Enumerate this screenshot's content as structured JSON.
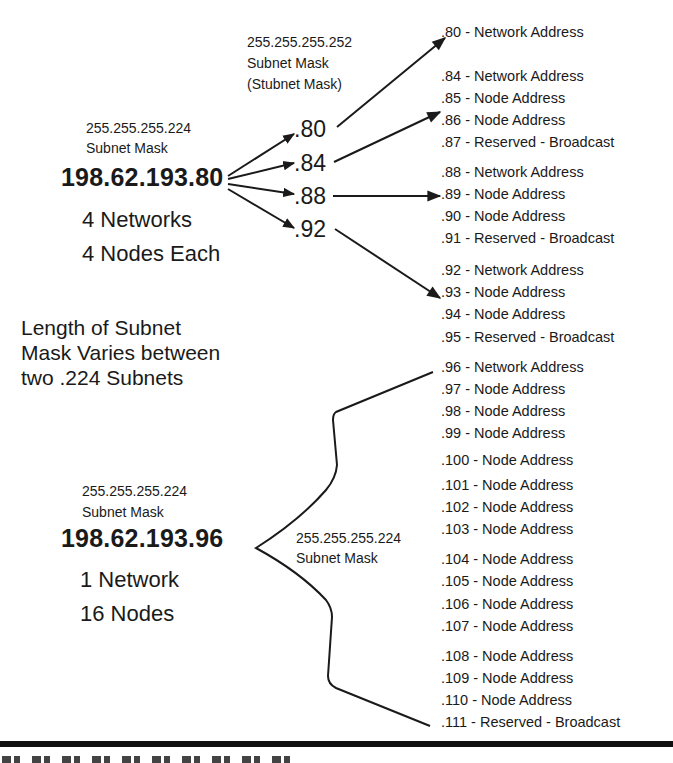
{
  "top_group": {
    "mask_value": "255.255.255.224",
    "mask_label": "Subnet Mask",
    "ip": "198.62.193.80",
    "networks": "4 Networks",
    "nodes": "4 Nodes Each"
  },
  "stubnet": {
    "mask_value": "255.255.255.252",
    "mask_label": "Subnet Mask",
    "mask_alias": "(Stubnet Mask)"
  },
  "octets": [
    ".80",
    ".84",
    ".88",
    ".92"
  ],
  "note": {
    "line1": "Length  of Subnet",
    "line2": "Mask Varies between",
    "line3": "two .224 Subnets"
  },
  "bottom_group": {
    "mask_value": "255.255.255.224",
    "mask_label": "Subnet Mask",
    "ip": "198.62.193.96",
    "networks": "1 Network",
    "nodes": "16 Nodes"
  },
  "brace_label": {
    "mask_value": "255.255.255.224",
    "mask_label": "Subnet Mask"
  },
  "addresses": [
    {
      "y": 23,
      "text": ".80 - Network Address"
    },
    {
      "y": 67,
      "text": ".84 - Network Address"
    },
    {
      "y": 89,
      "text": ".85 - Node Address"
    },
    {
      "y": 111,
      "text": ".86 - Node Address"
    },
    {
      "y": 133,
      "text": ".87 - Reserved - Broadcast"
    },
    {
      "y": 163,
      "text": ".88 - Network Address"
    },
    {
      "y": 185,
      "text": ".89 - Node Address"
    },
    {
      "y": 207,
      "text": ".90 - Node Address"
    },
    {
      "y": 229,
      "text": ".91 - Reserved - Broadcast"
    },
    {
      "y": 261,
      "text": ".92 - Network Address"
    },
    {
      "y": 283,
      "text": ".93 - Node Address"
    },
    {
      "y": 305,
      "text": ".94 - Node Address"
    },
    {
      "y": 328,
      "text": ".95 - Reserved - Broadcast"
    },
    {
      "y": 358,
      "text": ".96 - Network Address"
    },
    {
      "y": 380,
      "text": ".97 - Node Address"
    },
    {
      "y": 402,
      "text": ".98 - Node Address"
    },
    {
      "y": 424,
      "text": ".99 - Node Address"
    },
    {
      "y": 451,
      "text": ".100 - Node Address"
    },
    {
      "y": 476,
      "text": ".101 - Node Address"
    },
    {
      "y": 498,
      "text": ".102 - Node Address"
    },
    {
      "y": 520,
      "text": ".103 - Node Address"
    },
    {
      "y": 550,
      "text": ".104 - Node Address"
    },
    {
      "y": 572,
      "text": ".105 - Node Address"
    },
    {
      "y": 595,
      "text": ".106 - Node Address"
    },
    {
      "y": 617,
      "text": ".107 - Node Address"
    },
    {
      "y": 647,
      "text": ".108 - Node Address"
    },
    {
      "y": 669,
      "text": ".109 - Node Address"
    },
    {
      "y": 691,
      "text": ".110 - Node Address"
    },
    {
      "y": 713,
      "text": ".111 - Reserved - Broadcast"
    }
  ],
  "colors": {
    "ink": "#1a1a1a",
    "background": "#ffffff"
  }
}
